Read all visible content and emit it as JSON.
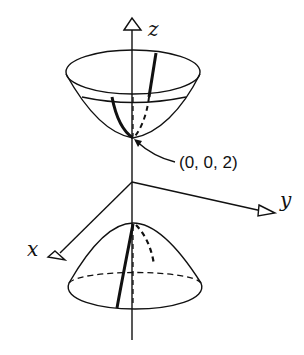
{
  "figure": {
    "type": "hyperboloid-of-two-sheets",
    "axes": {
      "z_label": "z",
      "y_label": "y",
      "x_label": "x"
    },
    "annotation": {
      "point_label": "(0, 0, 2)"
    },
    "colors": {
      "stroke": "#111111",
      "background": "#ffffff"
    }
  }
}
